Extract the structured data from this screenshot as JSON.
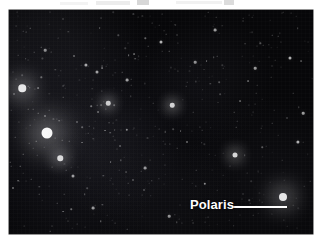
{
  "page": {
    "background_color": "#ffffff",
    "artifact_color": "#c9c9c9"
  },
  "photo": {
    "name": "night-sky-star-field-photograph",
    "sky_color": "#08080b",
    "glow_color": "#15151a",
    "star_color": "#ffffff",
    "bounds": {
      "x": 9,
      "y": 10,
      "width": 304,
      "height": 224
    }
  },
  "annotation": {
    "label": "Polaris",
    "label_color": "#ffffff",
    "leader_line_color": "#ffffff",
    "leader_line": {
      "x": 224,
      "y": 196,
      "length": 54
    },
    "target_star": {
      "x": 283,
      "y": 197
    }
  },
  "chart_data": {
    "type": "scatter",
    "title": "",
    "xlabel": "",
    "ylabel": "",
    "xlim": [
      0,
      304
    ],
    "ylim": [
      0,
      224
    ],
    "grid": false,
    "legend": "none",
    "annotations": [
      {
        "text": "Polaris",
        "x": 274,
        "y": 187,
        "leader_to_x": 274,
        "leader_to_y": 187
      }
    ],
    "series": [
      {
        "name": "bright-stars",
        "points": [
          {
            "x": 13,
            "y": 78,
            "size": 7.5,
            "brightness": 1.0
          },
          {
            "x": 38,
            "y": 123,
            "size": 11,
            "brightness": 1.0
          },
          {
            "x": 274,
            "y": 187,
            "size": 8,
            "brightness": 1.0
          },
          {
            "x": 51,
            "y": 148,
            "size": 5.5,
            "brightness": 0.92
          },
          {
            "x": 226,
            "y": 145,
            "size": 5,
            "brightness": 0.9
          },
          {
            "x": 99,
            "y": 93,
            "size": 4.5,
            "brightness": 0.85
          },
          {
            "x": 163,
            "y": 95,
            "size": 4.5,
            "brightness": 0.85
          }
        ]
      },
      {
        "name": "medium-stars",
        "points": [
          {
            "x": 77,
            "y": 55,
            "size": 3.2,
            "brightness": 0.7
          },
          {
            "x": 88,
            "y": 62,
            "size": 3.0,
            "brightness": 0.66
          },
          {
            "x": 118,
            "y": 70,
            "size": 2.8,
            "brightness": 0.62
          },
          {
            "x": 152,
            "y": 32,
            "size": 3.0,
            "brightness": 0.7
          },
          {
            "x": 186,
            "y": 52,
            "size": 2.6,
            "brightness": 0.6
          },
          {
            "x": 206,
            "y": 20,
            "size": 2.8,
            "brightness": 0.62
          },
          {
            "x": 246,
            "y": 58,
            "size": 2.6,
            "brightness": 0.6
          },
          {
            "x": 281,
            "y": 48,
            "size": 3.0,
            "brightness": 0.68
          },
          {
            "x": 289,
            "y": 132,
            "size": 3.2,
            "brightness": 0.72
          },
          {
            "x": 294,
            "y": 103,
            "size": 2.6,
            "brightness": 0.6
          },
          {
            "x": 64,
            "y": 166,
            "size": 3.0,
            "brightness": 0.68
          },
          {
            "x": 136,
            "y": 158,
            "size": 2.8,
            "brightness": 0.64
          },
          {
            "x": 84,
            "y": 198,
            "size": 2.8,
            "brightness": 0.64
          },
          {
            "x": 160,
            "y": 206,
            "size": 2.6,
            "brightness": 0.6
          },
          {
            "x": 196,
            "y": 174,
            "size": 2.4,
            "brightness": 0.56
          },
          {
            "x": 118,
            "y": 120,
            "size": 2.4,
            "brightness": 0.56
          },
          {
            "x": 36,
            "y": 40,
            "size": 2.6,
            "brightness": 0.6
          }
        ]
      },
      {
        "name": "faint-field-stars",
        "count": 430,
        "size_range": [
          0.6,
          2.0
        ],
        "brightness_range": [
          0.12,
          0.5
        ]
      }
    ]
  }
}
